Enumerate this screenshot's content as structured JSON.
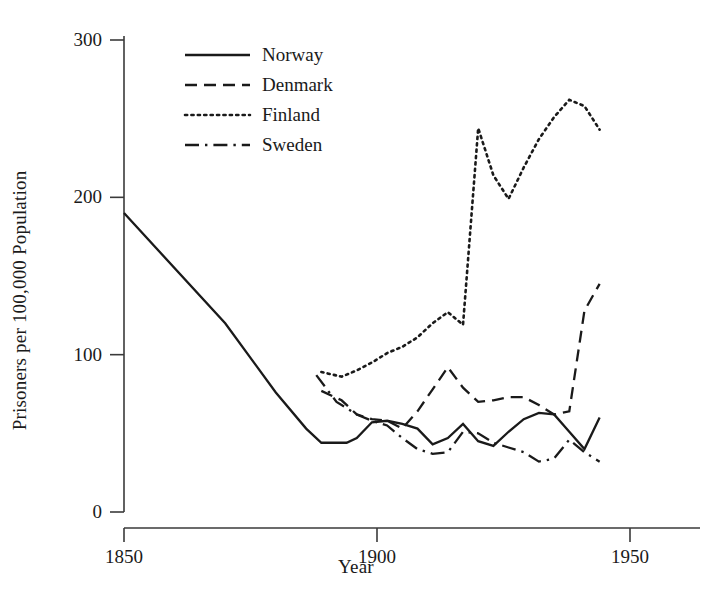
{
  "chart_data": {
    "type": "line",
    "title": "",
    "xlabel": "Year",
    "ylabel": "Prisoners per 100,000 Population",
    "xlim": [
      1845,
      1952
    ],
    "ylim": [
      0,
      312
    ],
    "grid": false,
    "legend_position": "top-left-inside",
    "xticks": [
      1850,
      1900,
      1950
    ],
    "xtick_labels": [
      "1850",
      "1900",
      "1950"
    ],
    "yticks": [
      0,
      100,
      200,
      300
    ],
    "ytick_labels": [
      "0",
      "100",
      "200",
      "300"
    ],
    "series": [
      {
        "name": "Norway",
        "style": "solid",
        "color": "#1a1a1a",
        "x": [
          1850,
          1870,
          1880,
          1886,
          1889,
          1894,
          1896,
          1899,
          1902,
          1905,
          1908,
          1911,
          1914,
          1917,
          1920,
          1923,
          1926,
          1929,
          1932,
          1935,
          1938,
          1941,
          1944
        ],
        "y": [
          190,
          120,
          76,
          53,
          44,
          44,
          47,
          57,
          58,
          56,
          53,
          43,
          47,
          56,
          45,
          42,
          51,
          59,
          63,
          62,
          51,
          40,
          60
        ]
      },
      {
        "name": "Denmark",
        "style": "dashed",
        "color": "#1a1a1a",
        "x": [
          1889,
          1893,
          1896,
          1899,
          1902,
          1905,
          1908,
          1911,
          1914,
          1917,
          1920,
          1923,
          1926,
          1929,
          1932,
          1935,
          1938,
          1941,
          1944
        ],
        "y": [
          77,
          71,
          62,
          59,
          58,
          53,
          64,
          78,
          92,
          79,
          70,
          71,
          73,
          73,
          68,
          62,
          64,
          128,
          145
        ]
      },
      {
        "name": "Finland",
        "style": "dotted",
        "color": "#1a1a1a",
        "x": [
          1889,
          1893,
          1896,
          1899,
          1902,
          1905,
          1908,
          1911,
          1914,
          1917,
          1920,
          1923,
          1926,
          1929,
          1932,
          1935,
          1938,
          1941,
          1944
        ],
        "y": [
          89,
          86,
          90,
          95,
          101,
          105,
          111,
          120,
          127,
          119,
          244,
          214,
          199,
          219,
          237,
          251,
          262,
          258,
          243
        ]
      },
      {
        "name": "Sweden",
        "style": "dashdot",
        "color": "#1a1a1a",
        "x": [
          1888,
          1892,
          1896,
          1899,
          1902,
          1905,
          1908,
          1911,
          1914,
          1917,
          1920,
          1923,
          1926,
          1929,
          1932,
          1935,
          1938,
          1941,
          1944
        ],
        "y": [
          87,
          70,
          62,
          58,
          55,
          47,
          40,
          37,
          38,
          51,
          50,
          44,
          41,
          38,
          32,
          34,
          46,
          38,
          32
        ]
      }
    ]
  },
  "legend": {
    "items": [
      {
        "label": "Norway",
        "style": "solid"
      },
      {
        "label": "Denmark",
        "style": "dashed"
      },
      {
        "label": "Finland",
        "style": "dotted"
      },
      {
        "label": "Sweden",
        "style": "dashdot"
      }
    ]
  },
  "axes": {
    "y_title": "Prisoners per 100,000 Population",
    "x_title": "Year"
  }
}
